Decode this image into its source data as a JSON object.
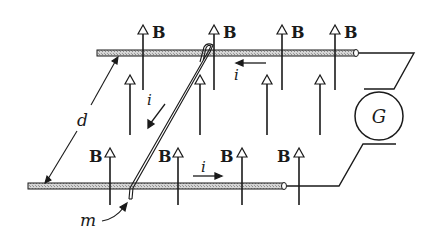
{
  "diagram": {
    "labels": {
      "field": "B",
      "current": "i",
      "separation": "d",
      "galvanometer": "G",
      "rod": "m"
    },
    "field_arrows": {
      "top_row_labeled": [
        "B",
        "B",
        "B",
        "B"
      ],
      "bottom_row_labeled": [
        "B",
        "B",
        "B",
        "B"
      ]
    },
    "current_labels": [
      "i",
      "i",
      "i"
    ],
    "colors": {
      "ink": "#1a1a1a",
      "rail_fill": "#c8c8c8",
      "background": "#ffffff"
    }
  }
}
